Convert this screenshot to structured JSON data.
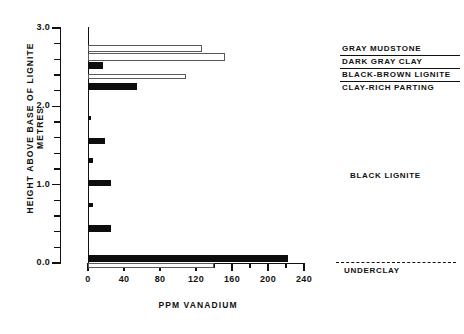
{
  "chart_data": {
    "type": "bar",
    "orientation": "horizontal",
    "title": "",
    "xlabel": "PPM VANADIUM",
    "ylabel_line1": "HEIGHT ABOVE BASE OF LIGNITE",
    "ylabel_line2": "METRES",
    "xlim": [
      0,
      250
    ],
    "ylim": [
      -0.08,
      3.05
    ],
    "xticks": [
      0,
      40,
      80,
      120,
      160,
      200,
      240
    ],
    "xticklabels": [
      "0",
      "40",
      "80",
      "120",
      "160",
      "200",
      "240"
    ],
    "x_minor_ticks": [
      20,
      60,
      100,
      140,
      180,
      220
    ],
    "yticks": [
      0.0,
      1.0,
      2.0,
      3.0
    ],
    "yticklabels": [
      "0.0",
      "1.0",
      "2.0",
      "3.0"
    ],
    "y_minor_ticks": [
      0.2,
      0.4,
      0.6,
      0.8,
      1.2,
      1.4,
      1.6,
      1.8,
      2.2,
      2.4,
      2.6,
      2.8
    ],
    "grid": false,
    "legend": "none",
    "fill_colors": {
      "filled": "#0d0d0d",
      "open": "#ffffff",
      "open_edge": "#5a5a5a"
    },
    "series": [
      {
        "name": "filled",
        "label": "Black lignite / black-brown lignite",
        "color": "#0d0d0d"
      },
      {
        "name": "open",
        "label": "Gray mudstone / dark gray clay / clay-rich parting",
        "color": "#ffffff"
      }
    ],
    "bars": [
      {
        "height_m": 2.74,
        "thickness_m": 0.085,
        "value": 127,
        "style": "open",
        "unit": "gray-mudstone"
      },
      {
        "height_m": 2.63,
        "thickness_m": 0.095,
        "value": 152,
        "style": "open",
        "unit": "dark-gray-clay"
      },
      {
        "height_m": 2.52,
        "thickness_m": 0.08,
        "value": 17,
        "style": "filled",
        "unit": "black-brown-lignite"
      },
      {
        "height_m": 2.38,
        "thickness_m": 0.075,
        "value": 109,
        "style": "open",
        "unit": "clay-rich-parting"
      },
      {
        "height_m": 2.25,
        "thickness_m": 0.095,
        "value": 54,
        "style": "filled",
        "unit": "black-lignite"
      },
      {
        "height_m": 1.85,
        "thickness_m": 0.06,
        "value": 3,
        "style": "filled",
        "unit": "black-lignite"
      },
      {
        "height_m": 1.56,
        "thickness_m": 0.075,
        "value": 19,
        "style": "filled",
        "unit": "black-lignite"
      },
      {
        "height_m": 1.31,
        "thickness_m": 0.055,
        "value": 5,
        "style": "filled",
        "unit": "black-lignite"
      },
      {
        "height_m": 1.02,
        "thickness_m": 0.085,
        "value": 25,
        "style": "filled",
        "unit": "black-lignite"
      },
      {
        "height_m": 0.74,
        "thickness_m": 0.055,
        "value": 5,
        "style": "filled",
        "unit": "black-lignite"
      },
      {
        "height_m": 0.44,
        "thickness_m": 0.085,
        "value": 25,
        "style": "filled",
        "unit": "black-lignite"
      },
      {
        "height_m": 0.06,
        "thickness_m": 0.085,
        "value": 222,
        "style": "filled",
        "unit": "black-lignite"
      },
      {
        "height_m": -0.03,
        "thickness_m": 0.07,
        "value": 140,
        "style": "open",
        "unit": "underclay"
      }
    ],
    "annotations": [
      {
        "id": "gray-mudstone",
        "text": "GRAY MUDSTONE"
      },
      {
        "id": "dark-gray-clay",
        "text": "DARK GRAY CLAY"
      },
      {
        "id": "black-brown-lignite",
        "text": "BLACK-BROWN LIGNITE"
      },
      {
        "id": "clay-rich-parting",
        "text": "CLAY-RICH PARTING"
      },
      {
        "id": "black-lignite",
        "text": "BLACK LIGNITE"
      },
      {
        "id": "underclay",
        "text": "UNDERCLAY"
      }
    ]
  }
}
